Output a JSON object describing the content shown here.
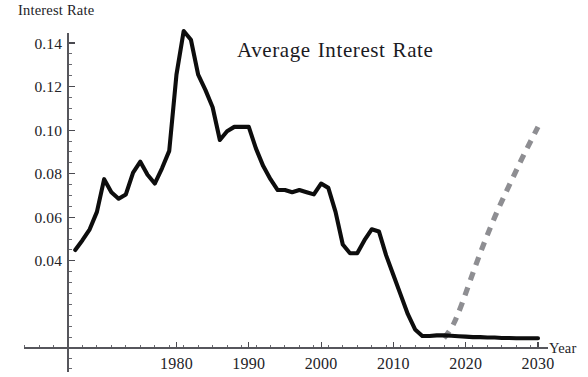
{
  "chart_data": {
    "type": "line",
    "xlabel": "Year",
    "ylabel": "Interest Rate",
    "xlim": [
      1965,
      2031
    ],
    "ylim": [
      0,
      0.155
    ],
    "grid": false,
    "legend": "none",
    "x_major_ticks": [
      1980,
      1990,
      2000,
      2010,
      2020,
      2030
    ],
    "x_major_tick_labels": [
      "1980",
      "1990",
      "2000",
      "2010",
      "2020",
      "2030"
    ],
    "x_minor_tick_step": 2,
    "y_major_ticks": [
      0.04,
      0.06,
      0.08,
      0.1,
      0.12,
      0.14
    ],
    "y_major_tick_labels": [
      "0.04",
      "0.06",
      "0.08",
      "0.10",
      "0.12",
      "0.14"
    ],
    "y_minor_tick_step": 0.005,
    "series": [
      {
        "name": "Historical average interest rate",
        "style": "solid",
        "color": "#0d0d0d",
        "x": [
          1966,
          1967,
          1968,
          1969,
          1970,
          1971,
          1972,
          1973,
          1974,
          1975,
          1976,
          1977,
          1978,
          1979,
          1980,
          1981,
          1982,
          1983,
          1984,
          1985,
          1986,
          1987,
          1988,
          1989,
          1990,
          1991,
          1992,
          1993,
          1994,
          1995,
          1996,
          1997,
          1998,
          1999,
          2000,
          2001,
          2002,
          2003,
          2004,
          2005,
          2006,
          2007,
          2008,
          2009,
          2010,
          2011,
          2012,
          2013,
          2014,
          2015,
          2016,
          2017,
          2018,
          2019,
          2020,
          2021,
          2022,
          2023,
          2024,
          2025,
          2026,
          2027,
          2028,
          2029,
          2030
        ],
        "y": [
          0.045,
          0.0495,
          0.0545,
          0.0625,
          0.0775,
          0.0715,
          0.0685,
          0.0705,
          0.0805,
          0.0855,
          0.0795,
          0.0755,
          0.0825,
          0.0905,
          0.1255,
          0.1455,
          0.1415,
          0.1255,
          0.1185,
          0.1105,
          0.0955,
          0.0995,
          0.1015,
          0.1015,
          0.1015,
          0.0915,
          0.0835,
          0.0775,
          0.0725,
          0.0725,
          0.0715,
          0.0725,
          0.0715,
          0.0705,
          0.0755,
          0.0735,
          0.0625,
          0.0475,
          0.0435,
          0.0435,
          0.0495,
          0.0545,
          0.0535,
          0.0425,
          0.0335,
          0.0245,
          0.0155,
          0.0085,
          0.0055,
          0.0055,
          0.0058,
          0.0058,
          0.0056,
          0.0054,
          0.0052,
          0.005,
          0.005,
          0.0048,
          0.0048,
          0.0046,
          0.0046,
          0.0045,
          0.0045,
          0.0045,
          0.0045
        ]
      },
      {
        "name": "Projected average interest rate",
        "style": "dashed",
        "color": "#8e8e92",
        "x": [
          2017,
          2018,
          2019,
          2020,
          2021,
          2022,
          2023,
          2024,
          2025,
          2026,
          2027,
          2028,
          2029,
          2030
        ],
        "y": [
          0.0045,
          0.0085,
          0.016,
          0.025,
          0.0345,
          0.0435,
          0.052,
          0.06,
          0.0675,
          0.0745,
          0.0815,
          0.0885,
          0.095,
          0.1015
        ]
      }
    ]
  },
  "axes": {
    "y_title": "Interest Rate",
    "x_title": "Year"
  },
  "title": {
    "part1": "Average",
    "part2": "Interest",
    "part3": "Rate"
  }
}
